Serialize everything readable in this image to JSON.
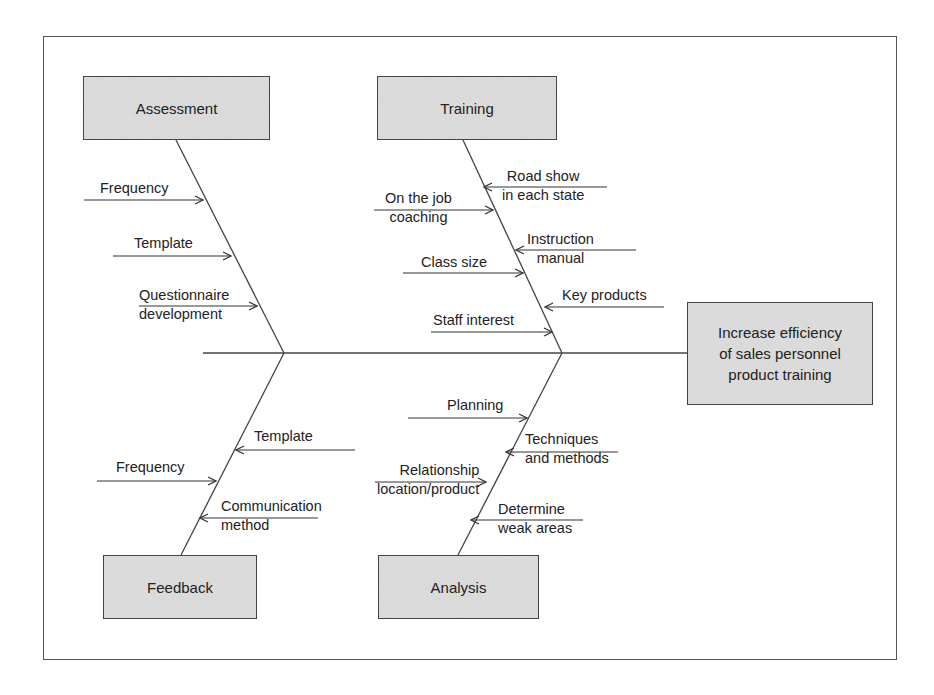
{
  "diagram": {
    "type": "fishbone",
    "effect": "Increase efficiency of sales personnel product training",
    "effect_lines": [
      "Increase efficiency",
      "of sales personnel",
      "product training"
    ],
    "categories": {
      "assessment": {
        "label": "Assessment",
        "causes": [
          "Frequency",
          "Template",
          "Questionnaire development"
        ],
        "cause_lines": [
          [
            "Frequency"
          ],
          [
            "Template"
          ],
          [
            "Questionnaire",
            "development"
          ]
        ]
      },
      "training": {
        "label": "Training",
        "causes": [
          "Road show in each state",
          "On the job coaching",
          "Instruction manual",
          "Class size",
          "Key products",
          "Staff interest"
        ],
        "cause_lines": [
          [
            "Road show",
            "in each state"
          ],
          [
            "On the job",
            "coaching"
          ],
          [
            "Instruction",
            "manual"
          ],
          [
            "Class size"
          ],
          [
            "Key products"
          ],
          [
            "Staff interest"
          ]
        ]
      },
      "feedback": {
        "label": "Feedback",
        "causes": [
          "Template",
          "Frequency",
          "Communication method"
        ],
        "cause_lines": [
          [
            "Template"
          ],
          [
            "Frequency"
          ],
          [
            "Communication",
            "method"
          ]
        ]
      },
      "analysis": {
        "label": "Analysis",
        "causes": [
          "Planning",
          "Techniques and methods",
          "Relationship location/product",
          "Determine weak areas"
        ],
        "cause_lines": [
          [
            "Planning"
          ],
          [
            "Techniques",
            "and methods"
          ],
          [
            "Relationship",
            "location/product"
          ],
          [
            "Determine",
            "weak areas"
          ]
        ]
      }
    },
    "colors": {
      "box_fill": "#d9d9d9",
      "stroke": "#444444",
      "background": "#ffffff"
    }
  }
}
